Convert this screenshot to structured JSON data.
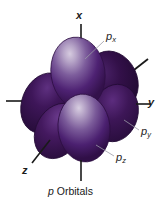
{
  "figure": {
    "caption_italic": "p",
    "caption_rest": " Orbitals",
    "background_color": "#ffffff",
    "axis_line_color": "#1a1a1a",
    "leader_line_color": "#9a9aa6",
    "lobe_colors": {
      "highlight": "#cfc2da",
      "light": "#9b86b4",
      "mid": "#5b2a80",
      "dark": "#3a1456",
      "darkest": "#250b38",
      "outline": "#2a0f3a"
    }
  },
  "axes": [
    {
      "name": "x",
      "label": "x",
      "direction": "vertical-up"
    },
    {
      "name": "y",
      "label": "y",
      "direction": "horizontal-right"
    },
    {
      "name": "z",
      "label": "z",
      "direction": "diagonal-lower-left"
    }
  ],
  "orbital_labels": [
    {
      "name": "p-sub-x",
      "base": "p",
      "sub": "x"
    },
    {
      "name": "p-sub-y",
      "base": "p",
      "sub": "y"
    },
    {
      "name": "p-sub-z",
      "base": "p",
      "sub": "z"
    }
  ],
  "lobes": [
    {
      "name": "px-up",
      "axis": "x",
      "sign": "+",
      "shading": "bright-front"
    },
    {
      "name": "px-down",
      "axis": "x",
      "sign": "-",
      "shading": "bright-front"
    },
    {
      "name": "py-right",
      "axis": "y",
      "sign": "+",
      "shading": "dark"
    },
    {
      "name": "py-left",
      "axis": "y",
      "sign": "-",
      "shading": "dark"
    },
    {
      "name": "pz-front",
      "axis": "z",
      "sign": "-",
      "shading": "mid"
    },
    {
      "name": "pz-back",
      "axis": "z",
      "sign": "+",
      "shading": "darkest"
    }
  ]
}
